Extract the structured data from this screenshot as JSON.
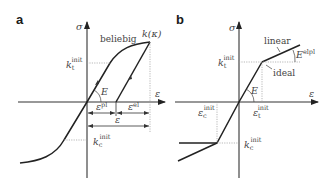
{
  "panel_a": {
    "label": "a",
    "y_axis": "σ",
    "x_axis": "ε",
    "curve_label": "beliebig",
    "peak_label": "k(κ)",
    "yield_tension": {
      "base": "k",
      "sub": "t",
      "sup": "init"
    },
    "yield_compression": {
      "base": "k",
      "sub": "c",
      "sup": "init"
    },
    "modulus": "E",
    "strain_plastic": {
      "base": "ε",
      "sup": "pl"
    },
    "strain_elastic": {
      "base": "ε",
      "sup": "el"
    },
    "strain_total": "ε"
  },
  "panel_b": {
    "label": "b",
    "y_axis": "σ",
    "x_axis": "ε",
    "hardening_label": "linear",
    "ideal_label": "ideal",
    "modulus": "E",
    "hardening_modulus": {
      "base": "E",
      "sup": "elpl"
    },
    "yield_tension": {
      "base": "k",
      "sub": "t",
      "sup": "init"
    },
    "yield_compression": {
      "base": "k",
      "sub": "c",
      "sup": "init"
    },
    "strain_tension": {
      "base": "ε",
      "sub": "t",
      "sup": "init"
    },
    "strain_compression": {
      "base": "ε",
      "sub": "c",
      "sup": "init"
    }
  }
}
